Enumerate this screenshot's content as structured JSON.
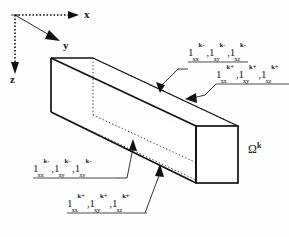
{
  "figure": {
    "type": "3d-beam-element-diagram",
    "background_color": "#fefefe",
    "line_color": "#111111",
    "axes": {
      "origin_label": "",
      "x_label": "x",
      "y_label": "y",
      "z_label": "z",
      "x_style": "dotted-arrow-right",
      "y_style": "solid-arrow-diagonal",
      "z_style": "dotted-arrow-down"
    },
    "domain_label": {
      "base": "Ω",
      "superscript": "k"
    },
    "labels": [
      {
        "id": "top-left-minus",
        "position": "upper-middle-right",
        "superscript": "k-",
        "terms": [
          {
            "base": "1",
            "sub": "xx",
            "sup": "k-"
          },
          {
            "base": "1",
            "sub": "xy",
            "sup": "k-"
          },
          {
            "base": "1",
            "sub": "xz",
            "sup": "k-"
          }
        ],
        "text": "1xx k-, 1xy k-, 1xz k-",
        "leader": "arrow-to-top-edge",
        "underlined": true
      },
      {
        "id": "top-right-plus",
        "position": "right-upper",
        "superscript": "k+",
        "terms": [
          {
            "base": "1",
            "sub": "xx",
            "sup": "k+"
          },
          {
            "base": "1",
            "sub": "xy",
            "sup": "k+"
          },
          {
            "base": "1",
            "sub": "xz",
            "sup": "k+"
          }
        ],
        "text": "1xx k+, 1xy k+, 1xz k+",
        "leader": "arrow-to-side-face",
        "underlined": true
      },
      {
        "id": "bottom-left-minus",
        "position": "lower-left",
        "superscript": "k-",
        "terms": [
          {
            "base": "1",
            "sub": "xx",
            "sup": "k-"
          },
          {
            "base": "1",
            "sub": "xy",
            "sup": "k-"
          },
          {
            "base": "1",
            "sub": "xy",
            "sup": "k-"
          }
        ],
        "text": "1xx k-, 1xy k-, 1xy k-",
        "leader": "arrow-to-lower-edge",
        "underlined": true
      },
      {
        "id": "bottom-center-plus",
        "position": "bottom-center",
        "superscript": "k+",
        "terms": [
          {
            "base": "1",
            "sub": "xx",
            "sup": "k+"
          },
          {
            "base": "1",
            "sub": "xy",
            "sup": "k+"
          },
          {
            "base": "1",
            "sub": "xz",
            "sup": "k+"
          }
        ],
        "text": "1xx k+, 1xy k+, 1xz k+",
        "leader": "arrow-to-bottom-edge",
        "underlined": true
      }
    ]
  }
}
